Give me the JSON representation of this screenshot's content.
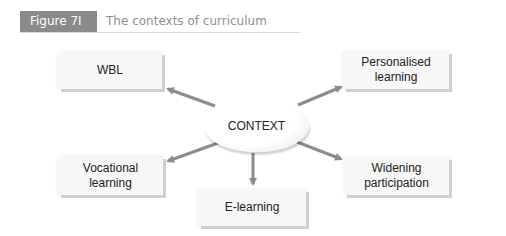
{
  "figure": {
    "label": "Figure 7I",
    "title": "The contexts of curriculum"
  },
  "diagram": {
    "center": "CONTEXT",
    "nodes": [
      {
        "id": "wbl",
        "label": "WBL"
      },
      {
        "id": "personalised",
        "label": "Personalised learning"
      },
      {
        "id": "vocational",
        "label": "Vocational learning"
      },
      {
        "id": "elearning",
        "label": "E-learning"
      },
      {
        "id": "widening",
        "label": "Widening participation"
      }
    ]
  },
  "colors": {
    "label_bg": "#8a8a8a",
    "title_text": "#8f8f8f",
    "arrow": "#8c8c8c",
    "box_bg": "#f7f7f7"
  }
}
